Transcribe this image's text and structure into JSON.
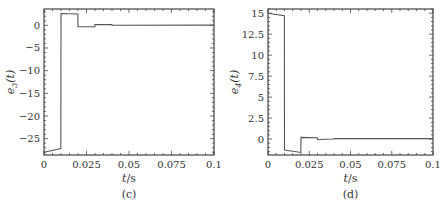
{
  "chart_data": [
    {
      "panel": "c",
      "type": "line",
      "title": "",
      "caption": "(c)",
      "xlabel": "t / s",
      "ylabel": "e3(t)",
      "ylabel_main": "e",
      "ylabel_sub": "3",
      "ylabel_arg": "(t)",
      "xlim": [
        0,
        0.1
      ],
      "ylim": [
        -28.6,
        3.6
      ],
      "xticks": [
        0,
        0.025,
        0.05,
        0.075,
        0.1
      ],
      "xtick_labels": [
        "0",
        "0.025",
        "0.05",
        "0.075",
        "0.1"
      ],
      "yticks": [
        0,
        -5,
        -10,
        -15,
        -20,
        -25
      ],
      "ytick_labels": [
        "0",
        "−5",
        "−10",
        "−15",
        "−20",
        "−25"
      ],
      "grid": false,
      "series": [
        {
          "name": "e3",
          "x": [
            0,
            0.0099,
            0.01,
            0.0199,
            0.02,
            0.0299,
            0.03,
            0.0399,
            0.04,
            0.1
          ],
          "y": [
            -28.0,
            -27.2,
            2.6,
            2.5,
            -0.3,
            -0.3,
            0.15,
            0.15,
            0.0,
            0.05
          ]
        }
      ]
    },
    {
      "panel": "d",
      "type": "line",
      "title": "",
      "caption": "(d)",
      "xlabel": "t / s",
      "ylabel": "e4(t)",
      "ylabel_main": "e",
      "ylabel_sub": "4",
      "ylabel_arg": "(t)",
      "xlim": [
        0,
        0.1
      ],
      "ylim": [
        -1.9,
        15.5
      ],
      "xticks": [
        0,
        0.025,
        0.05,
        0.075,
        0.1
      ],
      "xtick_labels": [
        "0",
        "0.025",
        "0.05",
        "0.075",
        "0.1"
      ],
      "yticks": [
        15,
        12.5,
        10,
        7.5,
        5,
        2.5,
        0
      ],
      "ytick_labels": [
        "15",
        "12.5",
        "10",
        "7.5",
        "5",
        "2.5",
        "0"
      ],
      "grid": false,
      "series": [
        {
          "name": "e4",
          "x": [
            0,
            0.0099,
            0.01,
            0.0199,
            0.02,
            0.0299,
            0.03,
            0.0399,
            0.04,
            0.1
          ],
          "y": [
            15.0,
            14.7,
            -1.3,
            -1.6,
            0.2,
            0.15,
            -0.05,
            0.0,
            0.05,
            0.05
          ]
        }
      ]
    }
  ]
}
